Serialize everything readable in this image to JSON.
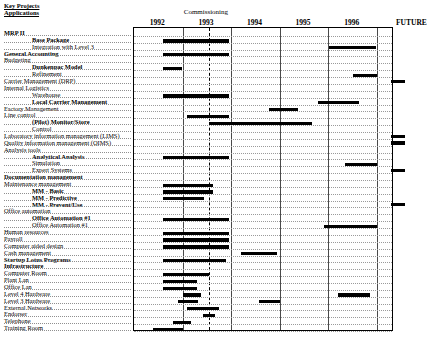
{
  "header": {
    "title_line1": "Key Projects",
    "title_line2": "Applications",
    "commissioning_label": "Commissioning",
    "future_label": "FUTURE"
  },
  "chart_data": {
    "type": "bar",
    "title": "Key Projects Applications",
    "subtitle": "Commissioning",
    "xlabel": "",
    "ylabel": "",
    "orientation": "horizontal",
    "style": "gantt",
    "grid": true,
    "legend": "none",
    "x_axis": {
      "tick_labels": [
        "1992",
        "1993",
        "1994",
        "1995",
        "1996",
        "FUTURE"
      ],
      "range_start": 1992.0,
      "range_end": 1997.0,
      "future_column": true
    },
    "annotations": [
      {
        "label": "Commissioning",
        "type": "vertical-dashed-line",
        "x": 1993.55
      }
    ],
    "categories": [
      "MRP II",
      "Base Package",
      "Integration with Level 3",
      "General Accounting",
      "Budgeting",
      "Dunkenpac Model",
      "Refinement",
      "Carrier Management (DRP)",
      "Internal Logistics",
      "Warehouse",
      "Local Carrier Management",
      "Factory Management",
      "Line control",
      "(Pilot) Monitor/Store",
      "Control",
      "Laboratory information management (LIMS)",
      "Quality information management (QIMS)",
      "Analysis tools",
      "Analytical Analysis",
      "Simulation",
      "Expert Systems",
      "Documentation management",
      "Maintenance  management",
      "MM - Basic",
      "MM - Predictive",
      "MM - Prevent/Use",
      "Office automation",
      "Office Automation #1",
      "Office Automation #1",
      "Human resources",
      "Payroll",
      "Computer aided design",
      "Cash management",
      "Startup Lotus Programs",
      "Infrastructure",
      "Computer Room",
      "Plant Lan",
      "Office Lan",
      "Level 4 Hardware",
      "Level 3 Hardware",
      "External Networks",
      "Endorser",
      "Telephone",
      "Training Room"
    ],
    "tasks": [
      {
        "name": "MRP II",
        "indent": 0,
        "bold": true,
        "bars": []
      },
      {
        "name": "Base Package",
        "indent": 2,
        "bold": true,
        "bars": [
          {
            "start": 1992.6,
            "end": 1993.96
          }
        ]
      },
      {
        "name": "Integration with Level 3",
        "indent": 2,
        "bold": false,
        "bars": [
          {
            "start": 1996.02,
            "end": 1996.98
          }
        ]
      },
      {
        "name": "General Accounting",
        "indent": 0,
        "bold": true,
        "bars": [
          {
            "start": 1992.6,
            "end": 1993.96
          }
        ]
      },
      {
        "name": "Budgeting",
        "indent": 0,
        "bold": false,
        "bars": []
      },
      {
        "name": "Dunkenpac Model",
        "indent": 2,
        "bold": true,
        "bars": [
          {
            "start": 1992.6,
            "end": 1992.99
          }
        ]
      },
      {
        "name": "Refinement",
        "indent": 2,
        "bold": false,
        "bars": [
          {
            "start": 1996.5,
            "end": 1997.0
          }
        ]
      },
      {
        "name": "Carrier Management (DRP)",
        "indent": 0,
        "bold": false,
        "bars": [
          {
            "start": 1997.05,
            "end": 1997.3
          }
        ]
      },
      {
        "name": "Internal Logistics",
        "indent": 0,
        "bold": false,
        "bars": []
      },
      {
        "name": "Warehouse",
        "indent": 2,
        "bold": false,
        "bars": [
          {
            "start": 1992.6,
            "end": 1993.96
          }
        ]
      },
      {
        "name": "Local Carrier Management",
        "indent": 2,
        "bold": true,
        "bars": [
          {
            "start": 1995.78,
            "end": 1996.62
          }
        ]
      },
      {
        "name": "Factory Management",
        "indent": 0,
        "bold": false,
        "bars": [
          {
            "start": 1994.78,
            "end": 1995.38
          }
        ]
      },
      {
        "name": "Line control",
        "indent": 0,
        "bold": false,
        "bars": [
          {
            "start": 1993.1,
            "end": 1993.96
          }
        ]
      },
      {
        "name": "(Pilot) Monitor/Store",
        "indent": 2,
        "bold": true,
        "bars": [
          {
            "start": 1993.55,
            "end": 1995.66
          }
        ]
      },
      {
        "name": "Control",
        "indent": 2,
        "bold": false,
        "bars": []
      },
      {
        "name": "Laboratory information management (LIMS)",
        "indent": 0,
        "bold": false,
        "bars": [
          {
            "start": 1997.05,
            "end": 1997.3
          }
        ]
      },
      {
        "name": "Quality information management (QIMS)",
        "indent": 0,
        "bold": false,
        "bars": [
          {
            "start": 1997.05,
            "end": 1997.3
          }
        ]
      },
      {
        "name": "Analysis tools",
        "indent": 0,
        "bold": false,
        "bars": []
      },
      {
        "name": "Analytical Analysis",
        "indent": 2,
        "bold": true,
        "bars": [
          {
            "start": 1992.6,
            "end": 1993.96
          }
        ]
      },
      {
        "name": "Simulation",
        "indent": 2,
        "bold": false,
        "bars": [
          {
            "start": 1996.35,
            "end": 1997.3
          }
        ]
      },
      {
        "name": "Expert Systems",
        "indent": 2,
        "bold": false,
        "bars": [
          {
            "start": 1997.05,
            "end": 1997.3
          }
        ]
      },
      {
        "name": "Documentation management",
        "indent": 0,
        "bold": true,
        "bars": []
      },
      {
        "name": "Maintenance  management",
        "indent": 0,
        "bold": false,
        "bars": [
          {
            "start": 1992.6,
            "end": 1993.62
          }
        ]
      },
      {
        "name": "MM - Basic",
        "indent": 2,
        "bold": true,
        "bars": [
          {
            "start": 1992.6,
            "end": 1993.62
          }
        ]
      },
      {
        "name": "MM - Predictive",
        "indent": 2,
        "bold": true,
        "bars": [
          {
            "start": 1992.6,
            "end": 1993.45
          }
        ]
      },
      {
        "name": "MM - Prevent/Use",
        "indent": 2,
        "bold": true,
        "bars": [
          {
            "start": 1997.05,
            "end": 1997.3
          }
        ]
      },
      {
        "name": "Office automation",
        "indent": 0,
        "bold": false,
        "bars": []
      },
      {
        "name": "Office Automation #1",
        "indent": 2,
        "bold": true,
        "bars": [
          {
            "start": 1992.6,
            "end": 1993.96
          }
        ]
      },
      {
        "name": "Office Automation #1",
        "indent": 2,
        "bold": false,
        "bars": [
          {
            "start": 1995.9,
            "end": 1997.0
          }
        ]
      },
      {
        "name": "Human resources",
        "indent": 0,
        "bold": false,
        "bars": [
          {
            "start": 1992.6,
            "end": 1993.96
          }
        ]
      },
      {
        "name": "Payroll",
        "indent": 0,
        "bold": false,
        "bars": [
          {
            "start": 1992.6,
            "end": 1993.96
          }
        ]
      },
      {
        "name": "Computer aided design",
        "indent": 0,
        "bold": false,
        "bars": [
          {
            "start": 1992.6,
            "end": 1993.96
          }
        ]
      },
      {
        "name": "Cash management",
        "indent": 0,
        "bold": false,
        "bars": [
          {
            "start": 1994.2,
            "end": 1994.95
          }
        ]
      },
      {
        "name": "Startup Lotus Programs",
        "indent": 0,
        "bold": true,
        "bars": [
          {
            "start": 1992.6,
            "end": 1993.9
          }
        ]
      },
      {
        "name": "Infrastructure",
        "indent": 0,
        "bold": true,
        "bars": []
      },
      {
        "name": "Computer Room",
        "indent": 0,
        "bold": false,
        "bars": [
          {
            "start": 1992.6,
            "end": 1993.55
          }
        ]
      },
      {
        "name": "Plant Lan",
        "indent": 0,
        "bold": false,
        "bars": [
          {
            "start": 1992.6,
            "end": 1993.3
          }
        ]
      },
      {
        "name": "Office Lan",
        "indent": 0,
        "bold": false,
        "bars": [
          {
            "start": 1992.6,
            "end": 1993.3
          }
        ]
      },
      {
        "name": "Level 4 Hardware",
        "indent": 0,
        "bold": false,
        "bars": [
          {
            "start": 1993.0,
            "end": 1993.38
          },
          {
            "start": 1996.2,
            "end": 1996.85
          }
        ]
      },
      {
        "name": "Level 3 Hardware",
        "indent": 0,
        "bold": false,
        "bars": [
          {
            "start": 1992.9,
            "end": 1993.32
          },
          {
            "start": 1994.58,
            "end": 1995.0
          }
        ]
      },
      {
        "name": "External Networks",
        "indent": 0,
        "bold": false,
        "bars": [
          {
            "start": 1993.1,
            "end": 1993.75
          }
        ]
      },
      {
        "name": "Endorser",
        "indent": 0,
        "bold": false,
        "bars": [
          {
            "start": 1993.42,
            "end": 1993.66
          }
        ]
      },
      {
        "name": "Telephone",
        "indent": 0,
        "bold": false,
        "bars": [
          {
            "start": 1992.8,
            "end": 1993.18
          }
        ]
      },
      {
        "name": "Training Room",
        "indent": 0,
        "bold": false,
        "bars": [
          {
            "start": 1992.4,
            "end": 1993.0
          }
        ]
      }
    ]
  }
}
